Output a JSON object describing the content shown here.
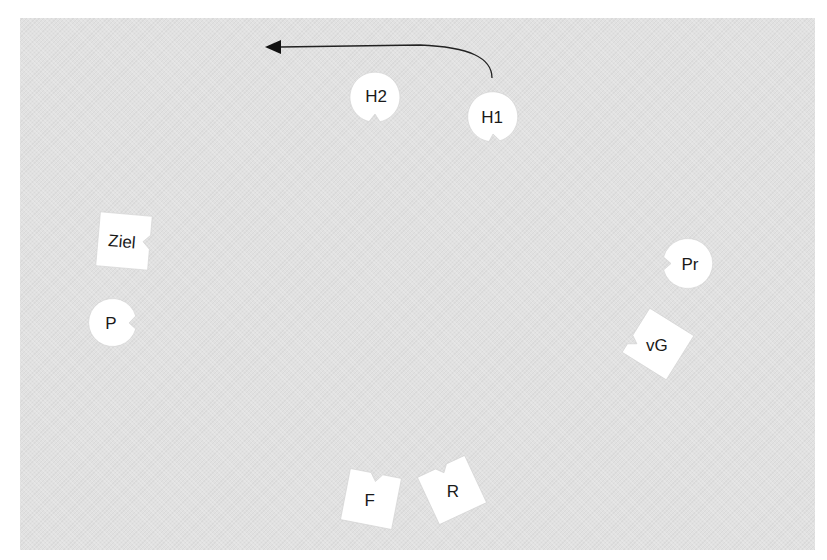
{
  "diagram": {
    "background_color": "#e1e1e1",
    "shape_fill": "#ffffff",
    "text_color": "#1a1a1a",
    "arrow": {
      "from": "H1",
      "direction": "left",
      "color": "#222222"
    },
    "nodes": [
      {
        "id": "H2",
        "label": "H2",
        "shape": "circle-notched",
        "notch_side": "bottom"
      },
      {
        "id": "H1",
        "label": "H1",
        "shape": "circle-notched",
        "notch_side": "bottom"
      },
      {
        "id": "Ziel",
        "label": "Ziel",
        "shape": "square-notched",
        "notch_side": "right"
      },
      {
        "id": "P",
        "label": "P",
        "shape": "circle-notched",
        "notch_side": "right"
      },
      {
        "id": "Pr",
        "label": "Pr",
        "shape": "circle-notched",
        "notch_side": "left"
      },
      {
        "id": "vG",
        "label": "vG",
        "shape": "square-notched",
        "notch_side": "top-left"
      },
      {
        "id": "F",
        "label": "F",
        "shape": "square-notched",
        "notch_side": "top"
      },
      {
        "id": "R",
        "label": "R",
        "shape": "square-notched",
        "notch_side": "top"
      }
    ]
  }
}
